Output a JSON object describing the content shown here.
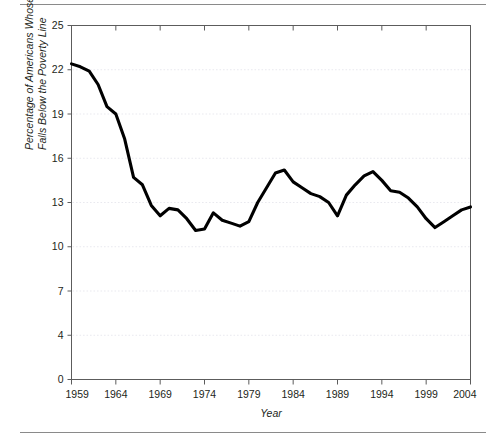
{
  "figure": {
    "background_color": "#ffffff",
    "rule_color": "#8a8a8a",
    "line_color": "#000000",
    "grid_color": "#e9e9ef",
    "axis_color": "#5c5c5c"
  },
  "axis": {
    "y_title_line1": "Percentage of Americans Whose Income",
    "y_title_line2": "Falls Below the Poverty Line",
    "x_title": "Year"
  },
  "chart_data": {
    "type": "line",
    "title": "",
    "xlabel": "Year",
    "ylabel": "Percentage of Americans Whose Income Falls Below the Poverty Line",
    "xlim": [
      1959,
      2004
    ],
    "ylim": [
      0,
      25
    ],
    "grid": true,
    "legend": "none",
    "x_tick_labels": [
      "1959",
      "1964",
      "1969",
      "1974",
      "1979",
      "1984",
      "1989",
      "1994",
      "1999",
      "2004"
    ],
    "x_ticks": [
      1959,
      1964,
      1969,
      1974,
      1979,
      1984,
      1989,
      1994,
      1999,
      2004
    ],
    "y_tick_labels": [
      "0",
      "4",
      "7",
      "10",
      "13",
      "16",
      "19",
      "22",
      "25"
    ],
    "y_ticks": [
      0,
      4,
      7,
      10,
      13,
      16,
      19,
      22,
      25
    ],
    "x": [
      1959,
      1960,
      1961,
      1962,
      1963,
      1964,
      1965,
      1966,
      1967,
      1968,
      1969,
      1970,
      1971,
      1972,
      1973,
      1974,
      1975,
      1976,
      1977,
      1978,
      1979,
      1980,
      1981,
      1982,
      1983,
      1984,
      1985,
      1986,
      1987,
      1988,
      1989,
      1990,
      1991,
      1992,
      1993,
      1994,
      1995,
      1996,
      1997,
      1998,
      1999,
      2000,
      2001,
      2002,
      2003,
      2004
    ],
    "values": [
      22.4,
      22.2,
      21.9,
      21.0,
      19.5,
      19.0,
      17.3,
      14.7,
      14.2,
      12.8,
      12.1,
      12.6,
      12.5,
      11.9,
      11.1,
      11.2,
      12.3,
      11.8,
      11.6,
      11.4,
      11.7,
      13.0,
      14.0,
      15.0,
      15.2,
      14.4,
      14.0,
      13.6,
      13.4,
      13.0,
      12.1,
      13.5,
      14.2,
      14.8,
      15.1,
      14.5,
      13.8,
      13.7,
      13.3,
      12.7,
      11.9,
      11.3,
      11.7,
      12.1,
      12.5,
      12.7
    ],
    "series": [
      {
        "name": "Poverty rate",
        "values": [
          22.4,
          22.2,
          21.9,
          21.0,
          19.5,
          19.0,
          17.3,
          14.7,
          14.2,
          12.8,
          12.1,
          12.6,
          12.5,
          11.9,
          11.1,
          11.2,
          12.3,
          11.8,
          11.6,
          11.4,
          11.7,
          13.0,
          14.0,
          15.0,
          15.2,
          14.4,
          14.0,
          13.6,
          13.4,
          13.0,
          12.1,
          13.5,
          14.2,
          14.8,
          15.1,
          14.5,
          13.8,
          13.7,
          13.3,
          12.7,
          11.9,
          11.3,
          11.7,
          12.1,
          12.5,
          12.7
        ]
      }
    ]
  }
}
